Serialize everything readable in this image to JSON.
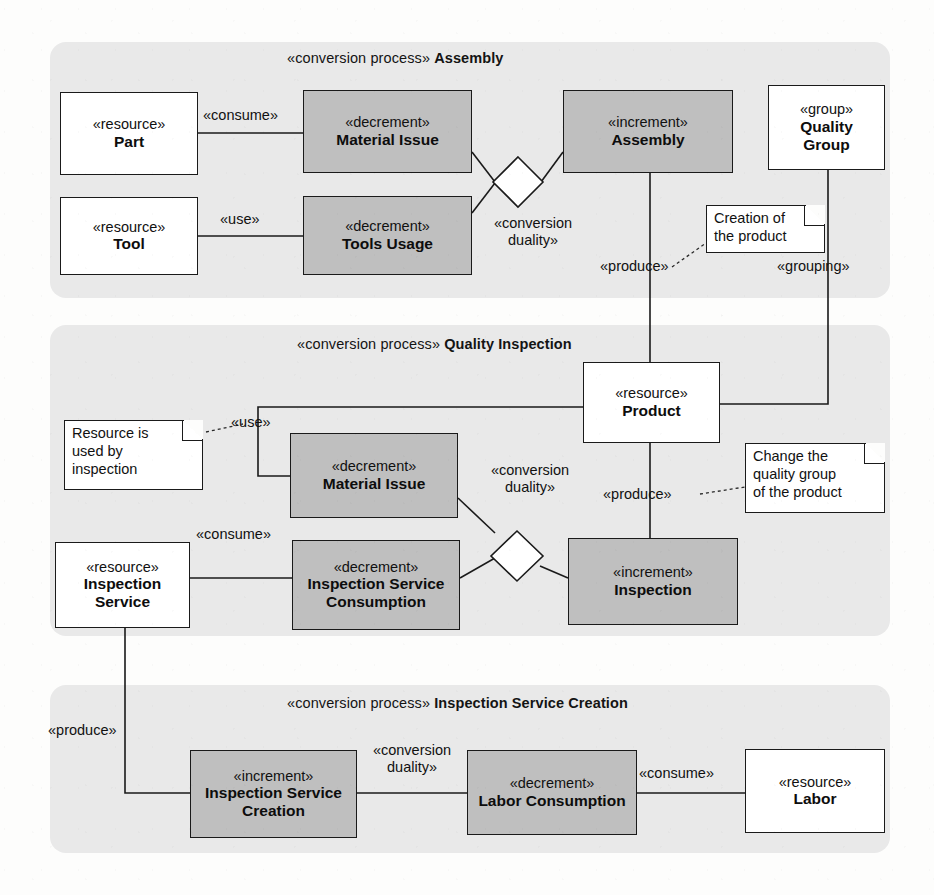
{
  "diagram": {
    "colors": {
      "panel_background": "#e9e9e9",
      "shaded_node": "#bfbfbf",
      "white_node": "#ffffff",
      "line": "#1a1a1a",
      "page": "#fdfdfc"
    }
  },
  "panels": [
    {
      "stereotype": "«conversion process»",
      "name": "Assembly"
    },
    {
      "stereotype": "«conversion process»",
      "name": "Quality Inspection"
    },
    {
      "stereotype": "«conversion process»",
      "name": "Inspection Service Creation"
    }
  ],
  "nodes": {
    "part": {
      "stereotype": "«resource»",
      "name": "Part",
      "kind": "resource"
    },
    "tool": {
      "stereotype": "«resource»",
      "name": "Tool",
      "kind": "resource"
    },
    "material_issue_1": {
      "stereotype": "«decrement»",
      "name": "Material Issue",
      "kind": "decrement"
    },
    "tools_usage": {
      "stereotype": "«decrement»",
      "name": "Tools Usage",
      "kind": "decrement"
    },
    "assembly": {
      "stereotype": "«increment»",
      "name": "Assembly",
      "kind": "increment"
    },
    "quality_group": {
      "stereotype": "«group»",
      "name": "Quality Group",
      "kind": "group"
    },
    "product": {
      "stereotype": "«resource»",
      "name": "Product",
      "kind": "resource"
    },
    "material_issue_2": {
      "stereotype": "«decrement»",
      "name": "Material Issue",
      "kind": "decrement"
    },
    "insp_svc_consume": {
      "stereotype": "«decrement»",
      "name": "Inspection Service Consumption",
      "kind": "decrement"
    },
    "inspection_service": {
      "stereotype": "«resource»",
      "name": "Inspection Service",
      "kind": "resource"
    },
    "inspection": {
      "stereotype": "«increment»",
      "name": "Inspection",
      "kind": "increment"
    },
    "insp_svc_creation": {
      "stereotype": "«increment»",
      "name": "Inspection Service Creation",
      "kind": "increment"
    },
    "labor_consumption": {
      "stereotype": "«decrement»",
      "name": "Labor Consumption",
      "kind": "decrement"
    },
    "labor": {
      "stereotype": "«resource»",
      "name": "Labor",
      "kind": "resource"
    }
  },
  "edge_labels": {
    "consume_top": "«consume»",
    "use_top": "«use»",
    "conversion_duality_top_l1": "«conversion",
    "conversion_duality_top_l2": "duality»",
    "produce_assembly": "«produce»",
    "grouping": "«grouping»",
    "use_mid": "«use»",
    "consume_mid": "«consume»",
    "conversion_duality_mid_l1": "«conversion",
    "conversion_duality_mid_l2": "duality»",
    "produce_inspection": "«produce»",
    "produce_service": "«produce»",
    "conversion_duality_bottom_l1": "«conversion",
    "conversion_duality_bottom_l2": "duality»",
    "consume_bottom": "«consume»"
  },
  "notes": {
    "creation_of_product": "Creation of\nthe product",
    "resource_used_by_inspection": "Resource is\nused by\ninspection",
    "change_quality_group": "Change the\nquality group\nof the product"
  }
}
